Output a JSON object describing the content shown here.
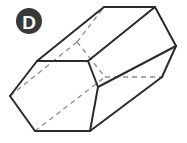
{
  "figure": {
    "type": "geometry-diagram",
    "label": "D",
    "shape_name": "hexagonal-prism",
    "canvas": {
      "width": 187,
      "height": 143,
      "background": "#ffffff"
    },
    "colors": {
      "visible_edge": "#2b2b2b",
      "hidden_edge": "#8d8d8d",
      "face_fill": "#ffffff",
      "badge_fill": "#3a3a3a",
      "badge_text": "#ffffff"
    },
    "badge": {
      "letter": "D",
      "center_x": 29,
      "center_y": 21,
      "radius": 13
    },
    "geometry": {
      "near_hexagon": {
        "name": "front-left-hexagonal-face",
        "points": "10,96 37,61 88,61 98,87 90,131 35,131"
      },
      "far_hexagon": {
        "name": "back-right-hexagonal-face",
        "points": "77,42 104,7 155,7 176,46 162,77 105,77"
      },
      "visible_outline": {
        "name": "prism-silhouette",
        "points": "10,96 37,61 104,7 155,7 176,46 162,77 90,131 35,131"
      },
      "visible_edges": [
        {
          "name": "near-top-left-slant",
          "points": "10,96 37,61"
        },
        {
          "name": "near-top-edge",
          "points": "37,61 88,61"
        },
        {
          "name": "near-upper-right-slant",
          "points": "88,61 98,87"
        },
        {
          "name": "near-lower-right-slant",
          "points": "98,87 90,131"
        },
        {
          "name": "near-bottom-edge",
          "points": "90,131 35,131"
        },
        {
          "name": "near-lower-left-slant",
          "points": "35,131 10,96"
        },
        {
          "name": "far-top-edge",
          "points": "104,7 155,7"
        },
        {
          "name": "far-upper-right-slant",
          "points": "155,7 176,46"
        },
        {
          "name": "far-lower-right-slant",
          "points": "176,46 162,77"
        },
        {
          "name": "connector-top-left",
          "points": "37,61 104,7"
        },
        {
          "name": "connector-upper-right",
          "points": "88,61 155,7"
        },
        {
          "name": "connector-mid-right",
          "points": "98,87 176,46"
        },
        {
          "name": "connector-bottom-right",
          "points": "90,131 162,77"
        }
      ],
      "hidden_edges": [
        {
          "name": "far-left-slant-hidden",
          "points": "77,42 104,7"
        },
        {
          "name": "far-lower-left-edge-hidden",
          "points": "77,42 105,77"
        },
        {
          "name": "far-bottom-edge-hidden",
          "points": "105,77 162,77"
        },
        {
          "name": "connector-left-hidden",
          "points": "10,96 77,42"
        },
        {
          "name": "connector-bottom-left-hidden",
          "points": "35,131 105,77"
        }
      ]
    }
  }
}
